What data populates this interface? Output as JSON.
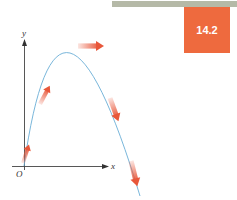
{
  "header": {
    "section_badge": "14.2",
    "badge_color": "#ee6a3e",
    "bar_color": "#b5b9a7"
  },
  "figure": {
    "axes": {
      "x_label": "x",
      "y_label": "y",
      "origin_label": "O"
    },
    "curve_color": "#6aaed6",
    "vector_color": "#e8573a",
    "velocity_vectors": [
      {
        "position": "launch",
        "direction": "up-right steep"
      },
      {
        "position": "rising",
        "direction": "up-right"
      },
      {
        "position": "peak",
        "direction": "horizontal right"
      },
      {
        "position": "falling",
        "direction": "down-right"
      },
      {
        "position": "late fall",
        "direction": "down-right steep"
      }
    ]
  }
}
